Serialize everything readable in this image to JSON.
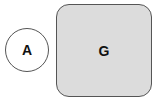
{
  "diagram": {
    "nodes": [
      {
        "id": "A",
        "label": "A",
        "shape": "circle",
        "fill": "#ffffff"
      },
      {
        "id": "G",
        "label": "G",
        "shape": "rounded-rectangle",
        "fill": "#dcdcdc"
      }
    ],
    "edges": []
  }
}
